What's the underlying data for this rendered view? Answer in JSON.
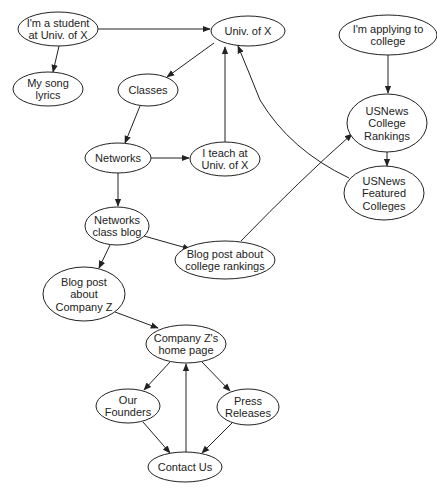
{
  "diagram": {
    "type": "directed-graph",
    "nodes": [
      {
        "id": "student",
        "lines": [
          "I'm a student",
          "at Univ. of X"
        ],
        "cx": 58,
        "cy": 29,
        "rx": 40,
        "ry": 17
      },
      {
        "id": "lyrics",
        "lines": [
          "My song",
          "lyrics"
        ],
        "cx": 48,
        "cy": 89,
        "rx": 35,
        "ry": 17
      },
      {
        "id": "univ",
        "lines": [
          "Univ. of X"
        ],
        "cx": 248,
        "cy": 31,
        "rx": 37,
        "ry": 15
      },
      {
        "id": "classes",
        "lines": [
          "Classes"
        ],
        "cx": 148,
        "cy": 90,
        "rx": 30,
        "ry": 16
      },
      {
        "id": "networks",
        "lines": [
          "Networks"
        ],
        "cx": 118,
        "cy": 158,
        "rx": 33,
        "ry": 15
      },
      {
        "id": "teach",
        "lines": [
          "I teach at",
          "Univ. of X"
        ],
        "cx": 225,
        "cy": 159,
        "rx": 35,
        "ry": 17
      },
      {
        "id": "blog",
        "lines": [
          "Networks",
          "class blog"
        ],
        "cx": 117,
        "cy": 226,
        "rx": 32,
        "ry": 19
      },
      {
        "id": "rankpost",
        "lines": [
          "Blog post about",
          "college rankings"
        ],
        "cx": 225,
        "cy": 260,
        "rx": 50,
        "ry": 19
      },
      {
        "id": "zpost",
        "lines": [
          "Blog post",
          "about",
          "Company Z"
        ],
        "cx": 84,
        "cy": 294,
        "rx": 41,
        "ry": 27
      },
      {
        "id": "zhome",
        "lines": [
          "Company Z's",
          "home page"
        ],
        "cx": 186,
        "cy": 344,
        "rx": 40,
        "ry": 19
      },
      {
        "id": "founders",
        "lines": [
          "Our",
          "Founders"
        ],
        "cx": 128,
        "cy": 406,
        "rx": 32,
        "ry": 17
      },
      {
        "id": "press",
        "lines": [
          "Press",
          "Releases"
        ],
        "cx": 248,
        "cy": 407,
        "rx": 31,
        "ry": 18
      },
      {
        "id": "contact",
        "lines": [
          "Contact Us"
        ],
        "cx": 185,
        "cy": 467,
        "rx": 37,
        "ry": 15
      },
      {
        "id": "applying",
        "lines": [
          "I'm applying to",
          "college"
        ],
        "cx": 388,
        "cy": 35,
        "rx": 49,
        "ry": 20
      },
      {
        "id": "usrank",
        "lines": [
          "USNews",
          "College",
          "Rankings"
        ],
        "cx": 387,
        "cy": 123,
        "rx": 40,
        "ry": 29
      },
      {
        "id": "usfeat",
        "lines": [
          "USNews",
          "Featured",
          "Colleges"
        ],
        "cx": 384,
        "cy": 193,
        "rx": 40,
        "ry": 27
      }
    ],
    "edges": [
      {
        "from": "student",
        "to": "univ",
        "path": "M98,29 L210,29"
      },
      {
        "from": "student",
        "to": "lyrics",
        "path": "M59,46 L53,72"
      },
      {
        "from": "univ",
        "to": "classes",
        "path": "M214,43 L167,77"
      },
      {
        "from": "classes",
        "to": "networks",
        "path": "M140,106 L125,143"
      },
      {
        "from": "networks",
        "to": "teach",
        "path": "M151,158 L189,158"
      },
      {
        "from": "teach",
        "to": "univ",
        "path": "M225,142 L225,47"
      },
      {
        "from": "networks",
        "to": "blog",
        "path": "M118,173 L118,206"
      },
      {
        "from": "blog",
        "to": "rankpost",
        "path": "M144,236 L190,249"
      },
      {
        "from": "blog",
        "to": "zpost",
        "path": "M110,245 L99,268"
      },
      {
        "from": "rankpost",
        "to": "usrank",
        "path": "M241,241 Q300,180 352,134"
      },
      {
        "from": "usfeat",
        "to": "univ",
        "path": "M349,178 Q290,150 260,100 Q250,75 238,46"
      },
      {
        "from": "applying",
        "to": "usrank",
        "path": "M388,55 L388,93"
      },
      {
        "from": "usrank",
        "to": "usfeat",
        "path": "M387,152 L387,166"
      },
      {
        "from": "zpost",
        "to": "zhome",
        "path": "M115,312 L158,328"
      },
      {
        "from": "zhome",
        "to": "founders",
        "path": "M170,362 L144,390"
      },
      {
        "from": "zhome",
        "to": "press",
        "path": "M202,362 L230,391"
      },
      {
        "from": "founders",
        "to": "contact",
        "path": "M143,422 L170,453"
      },
      {
        "from": "press",
        "to": "contact",
        "path": "M232,423 L202,453"
      },
      {
        "from": "contact",
        "to": "zhome",
        "path": "M186,452 L186,364"
      }
    ]
  }
}
